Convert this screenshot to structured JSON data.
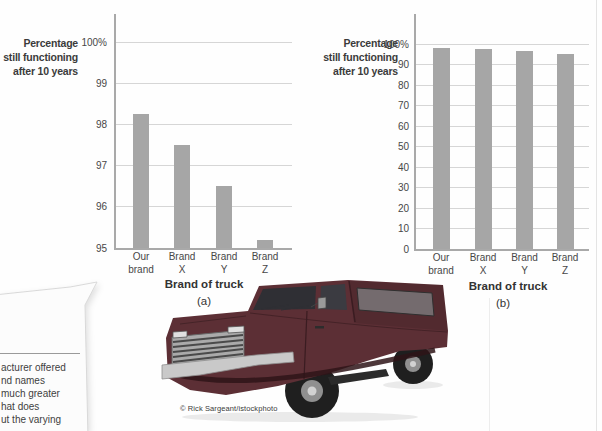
{
  "figure": {
    "credit": "© Rick Sargeant/istockphoto"
  },
  "chart_data": [
    {
      "type": "bar",
      "sublabel": "(a)",
      "title": "",
      "ylabel": "Percentage still functioning after 10 years",
      "ylabel_display": "Percentage\nstill functioning\nafter 10 years",
      "xlabel": "Brand of truck",
      "categories": [
        "Our brand",
        "Brand X",
        "Brand Y",
        "Brand Z"
      ],
      "values": [
        98.25,
        97.5,
        96.5,
        95.2
      ],
      "ylim": [
        95,
        100
      ],
      "yticks": [
        {
          "v": 100,
          "label": "100%"
        },
        {
          "v": 99,
          "label": "99"
        },
        {
          "v": 98,
          "label": "98"
        },
        {
          "v": 97,
          "label": "97"
        },
        {
          "v": 96,
          "label": "96"
        },
        {
          "v": 95,
          "label": "95"
        }
      ],
      "grid": true,
      "legend": null,
      "bar_color": "#a6a6a6"
    },
    {
      "type": "bar",
      "sublabel": "(b)",
      "title": "",
      "ylabel": "Percentage still functioning after 10 years",
      "ylabel_display": "Percentage\nstill functioning\nafter 10 years",
      "xlabel": "Brand of truck",
      "categories": [
        "Our brand",
        "Brand X",
        "Brand Y",
        "Brand Z"
      ],
      "values": [
        98.25,
        97.5,
        96.5,
        95.2
      ],
      "ylim": [
        0,
        100
      ],
      "yticks": [
        {
          "v": 100,
          "label": "100%"
        },
        {
          "v": 90,
          "label": "90"
        },
        {
          "v": 80,
          "label": "80"
        },
        {
          "v": 70,
          "label": "70"
        },
        {
          "v": 60,
          "label": "60"
        },
        {
          "v": 50,
          "label": "50"
        },
        {
          "v": 40,
          "label": "40"
        },
        {
          "v": 30,
          "label": "30"
        },
        {
          "v": 20,
          "label": "20"
        },
        {
          "v": 10,
          "label": "10"
        },
        {
          "v": 0,
          "label": "0"
        }
      ],
      "grid": true,
      "legend": null,
      "bar_color": "#a6a6a6"
    }
  ],
  "callout": {
    "visible_text": "acturer offered\nnd names\nmuch greater\nhat does\nut the varying"
  },
  "colors": {
    "bar": "#a6a6a6",
    "grid": "#d6d6d6",
    "axis": "#a9a9a9",
    "text": "#3d3d3d",
    "truck_body": "#5c2f35"
  }
}
